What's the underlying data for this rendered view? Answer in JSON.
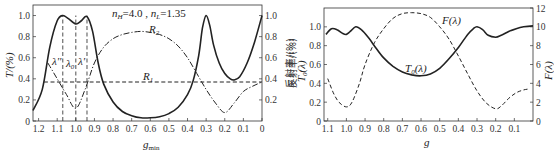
{
  "chart_data": [
    {
      "type": "line",
      "title": "",
      "annotation": "n_H=4.0, n_L=1.35",
      "xlabel": "g_min",
      "ylabel_left": "T/(%)",
      "ylabel_right": "反射率/(%)",
      "xlim": [
        1.23,
        0
      ],
      "ylim": [
        0,
        1.1
      ],
      "x_ticks": [
        "1.2",
        "1.1",
        "1.0",
        "0.9",
        "0.8",
        "0.7",
        "0.6",
        "0.5",
        "0.4",
        "0.3",
        "0.2",
        "0.1",
        "0"
      ],
      "y_ticks_left": [
        "0",
        "0.2",
        "0.4",
        "0.6",
        "0.8",
        "1.0"
      ],
      "y_ticks_right": [
        "0.2",
        "0.4",
        "0.6",
        "0.8",
        "1.0"
      ],
      "markers": [
        {
          "label": "λ''",
          "x": 1.07
        },
        {
          "label": "λ_0",
          "x": 1.0
        },
        {
          "label": "λ'",
          "x": 0.94
        }
      ],
      "series": [
        {
          "name": "T",
          "style": "solid",
          "x": [
            1.23,
            1.18,
            1.14,
            1.1,
            1.07,
            1.04,
            1.0,
            0.97,
            0.94,
            0.91,
            0.88,
            0.85,
            0.8,
            0.75,
            0.7,
            0.65,
            0.6,
            0.55,
            0.5,
            0.45,
            0.4,
            0.37,
            0.34,
            0.32,
            0.3,
            0.28,
            0.26,
            0.23,
            0.2,
            0.17,
            0.15,
            0.12,
            0.08,
            0.04,
            0
          ],
          "y": [
            0.1,
            0.3,
            0.7,
            0.95,
            1.0,
            0.97,
            0.92,
            0.95,
            0.99,
            0.85,
            0.55,
            0.35,
            0.18,
            0.09,
            0.05,
            0.03,
            0.03,
            0.04,
            0.07,
            0.13,
            0.25,
            0.38,
            0.62,
            0.88,
            1.0,
            0.9,
            0.72,
            0.55,
            0.45,
            0.4,
            0.39,
            0.42,
            0.55,
            0.75,
            1.0
          ]
        },
        {
          "name": "R_2",
          "style": "dash-dot",
          "x": [
            1.15,
            1.1,
            1.05,
            1.0,
            0.95,
            0.9,
            0.85,
            0.8,
            0.75,
            0.7,
            0.65,
            0.6,
            0.55,
            0.5,
            0.45,
            0.4,
            0.35,
            0.3,
            0.25,
            0.2,
            0.15,
            0.1,
            0.05,
            0
          ],
          "y": [
            0.55,
            0.4,
            0.25,
            0.12,
            0.3,
            0.55,
            0.7,
            0.78,
            0.82,
            0.84,
            0.85,
            0.84,
            0.82,
            0.78,
            0.71,
            0.6,
            0.45,
            0.3,
            0.17,
            0.08,
            0.17,
            0.28,
            0.33,
            0.37
          ]
        },
        {
          "name": "R_1",
          "style": "dashed",
          "x": [
            1.17,
            0
          ],
          "y": [
            0.37,
            0.37
          ]
        }
      ],
      "curve_labels": [
        {
          "text": "R_2",
          "x": 0.57,
          "y": 0.9
        },
        {
          "text": "R_1",
          "x": 0.52,
          "y": 0.42
        }
      ]
    },
    {
      "type": "line",
      "title": "",
      "xlabel": "g",
      "ylabel_left": "反射率/(%) T_0(λ)",
      "ylabel_right": "F(λ)",
      "xlim": [
        1.12,
        0
      ],
      "ylim_left": [
        0,
        1.2
      ],
      "ylim_right": [
        0,
        12
      ],
      "x_ticks": [
        "1.1",
        "1.0",
        "0.9",
        "0.8",
        "0.7",
        "0.6",
        "0.5",
        "0.4",
        "0.3",
        "0.2",
        "0.1"
      ],
      "y_ticks_left": [
        "0",
        "0.2",
        "0.4",
        "0.6",
        "0.8",
        "1.0"
      ],
      "y_ticks_right": [
        "0",
        "2",
        "4",
        "6",
        "8",
        "10",
        "12"
      ],
      "series": [
        {
          "name": "T_0(λ)",
          "style": "solid",
          "axis": "left",
          "x": [
            1.11,
            1.08,
            1.05,
            1.02,
            1.0,
            0.98,
            0.95,
            0.92,
            0.88,
            0.84,
            0.8,
            0.75,
            0.7,
            0.65,
            0.6,
            0.55,
            0.5,
            0.45,
            0.4,
            0.35,
            0.32,
            0.3,
            0.27,
            0.24,
            0.2,
            0.17,
            0.13,
            0.09,
            0.05,
            0
          ],
          "y": [
            0.92,
            0.98,
            0.97,
            0.93,
            0.92,
            0.95,
            1.0,
            0.97,
            0.88,
            0.77,
            0.67,
            0.58,
            0.52,
            0.49,
            0.48,
            0.5,
            0.56,
            0.66,
            0.78,
            0.92,
            0.98,
            1.0,
            0.97,
            0.91,
            0.89,
            0.91,
            0.95,
            0.98,
            1.0,
            1.01
          ]
        },
        {
          "name": "F(λ)",
          "style": "dashed",
          "axis": "right",
          "x": [
            1.1,
            1.07,
            1.04,
            1.0,
            0.97,
            0.93,
            0.9,
            0.85,
            0.8,
            0.75,
            0.7,
            0.65,
            0.6,
            0.55,
            0.5,
            0.45,
            0.4,
            0.35,
            0.3,
            0.25,
            0.2,
            0.17,
            0.13,
            0.09,
            0.05,
            0.02
          ],
          "y": [
            4.5,
            3.0,
            2.0,
            1.5,
            2.0,
            4.0,
            6.0,
            8.3,
            9.8,
            10.9,
            11.4,
            11.5,
            11.4,
            11.0,
            10.0,
            8.7,
            6.9,
            5.0,
            3.2,
            1.9,
            1.3,
            1.6,
            2.4,
            3.0,
            3.3,
            3.4
          ]
        }
      ],
      "curve_labels": [
        {
          "text": "F(λ)",
          "x": 0.5,
          "y_right": 10.5
        },
        {
          "text": "T_0(λ)",
          "x": 0.63,
          "y": 0.57
        }
      ]
    }
  ],
  "texts": {
    "left_annotation_nH": "n",
    "left_annotation_nH_sub": "H",
    "left_annotation_eq1": "=4.0 , ",
    "left_annotation_nL": "n",
    "left_annotation_nL_sub": "L",
    "left_annotation_eq2": "=1.35",
    "left_ylabel": "T/(%)",
    "left_ylabel_right": "反射率/(%)",
    "left_xlabel": "g",
    "left_xlabel_sub": "min",
    "label_R2": "R",
    "label_R2_sub": "2",
    "label_R1": "R",
    "label_R1_sub": "1",
    "marker_lpp": "λ''",
    "marker_l0": "λ",
    "marker_l0_sub": "0",
    "marker_lp": "λ'",
    "right_ylabel_cn": "反射率/(%)",
    "right_ylabel_T": "T",
    "right_ylabel_T_sub": "0",
    "right_ylabel_T_rest": "(λ)",
    "right_ylabel_F": "F(λ)",
    "right_xlabel": "g",
    "label_F": "F(λ)",
    "label_T0": "T",
    "label_T0_sub": "0",
    "label_T0_rest": "(λ)"
  }
}
